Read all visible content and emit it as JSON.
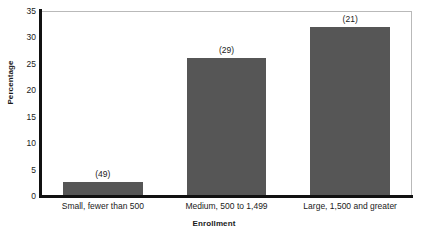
{
  "chart_data": {
    "type": "bar",
    "title": "",
    "subtitle": "",
    "xlabel": "Enrollment",
    "ylabel": "Percentage",
    "categories": [
      "Small, fewer than 500",
      "Medium, 500 to 1,499",
      "Large, 1,500 and greater"
    ],
    "values": [
      2.6,
      26.2,
      32.0
    ],
    "point_labels": [
      "(49)",
      "(29)",
      "(21)"
    ],
    "ylim": [
      0,
      35
    ],
    "yticks": [
      0,
      5,
      10,
      15,
      20,
      25,
      30,
      35
    ],
    "ytick_labels": [
      "0",
      "5",
      "10",
      "15",
      "20",
      "25",
      "30",
      "35"
    ],
    "grid": false,
    "legend": false,
    "legend_position": "none",
    "bar_color": "#565656",
    "axis_color": "#111111",
    "frame_color": "#b9b9b9",
    "text_color": "#1a1a1a"
  }
}
